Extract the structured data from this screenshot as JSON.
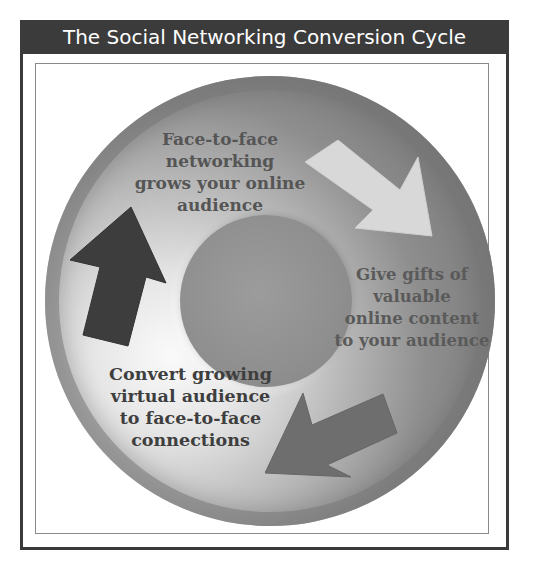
{
  "title": "The Social Networking Conversion Cycle",
  "cycle": {
    "steps": [
      {
        "position": "top",
        "text": "Face-to-face networking grows your online audience",
        "lines": [
          "Face-to-face",
          "networking",
          "grows your online",
          "audience"
        ]
      },
      {
        "position": "right",
        "text": "Give gifts of valuable online content to your audience",
        "lines": [
          "Give gifts of",
          "valuable",
          "online content",
          "to your audience"
        ]
      },
      {
        "position": "bottom-left",
        "text": "Convert growing virtual audience to face-to-face connections",
        "lines": [
          "Convert growing",
          "virtual audience",
          "to face-to-face",
          "connections"
        ]
      }
    ],
    "arrows": [
      {
        "name": "arrow-down-right",
        "direction": "down-right",
        "color": "#d8d8d8"
      },
      {
        "name": "arrow-down-left",
        "direction": "down-left",
        "color": "#6e6e6e"
      },
      {
        "name": "arrow-up",
        "direction": "up",
        "color": "#3d3d3d"
      }
    ]
  },
  "colors": {
    "title_bar": "#3b3b3b",
    "frame": "#3a3a3a",
    "disc_dark": "#707070",
    "disc_light": "#fafafa"
  }
}
